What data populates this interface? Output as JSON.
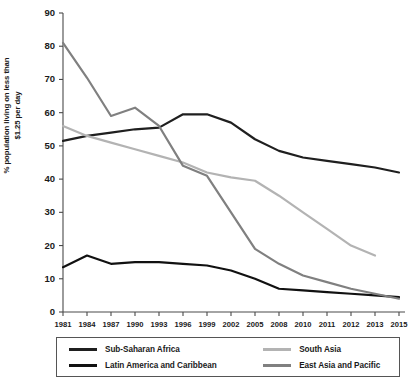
{
  "chart_data": {
    "type": "line",
    "title": "",
    "xlabel": "",
    "ylabel": "% population living on less than $1.25 per day",
    "ylim": [
      0,
      90
    ],
    "ytick_step": 10,
    "grid": false,
    "legend_position": "bottom",
    "categories": [
      "1981",
      "1984",
      "1987",
      "1990",
      "1993",
      "1996",
      "1999",
      "2002",
      "2005",
      "2008",
      "2010",
      "2011",
      "2012",
      "2013",
      "2015"
    ],
    "series": [
      {
        "name": "Sub-Saharan Africa",
        "color": "#1f1f1f",
        "values": [
          51.5,
          53,
          54,
          55,
          55.5,
          59.5,
          59.5,
          57,
          52,
          48.5,
          46.5,
          45.5,
          44.5,
          43.5,
          42
        ]
      },
      {
        "name": "South Asia",
        "color": "#b3b3b3",
        "values": [
          56,
          53,
          51,
          49,
          47,
          45,
          42,
          40.5,
          39.5,
          35,
          30,
          25,
          20,
          17,
          null
        ]
      },
      {
        "name": "Latin America and Caribbean",
        "color": "#111111",
        "values": [
          13.5,
          17,
          14.5,
          15,
          15,
          14.5,
          14,
          12.5,
          10,
          7,
          6.5,
          6,
          5.5,
          5,
          4.5
        ]
      },
      {
        "name": "East Asia and Pacific",
        "color": "#808080",
        "values": [
          81,
          70.5,
          59,
          61.5,
          56,
          44,
          41,
          30,
          19,
          14.5,
          11,
          9,
          7,
          5.5,
          4
        ]
      }
    ],
    "ytick_labels": [
      "0",
      "10",
      "20",
      "30",
      "40",
      "50",
      "60",
      "70",
      "80",
      "90"
    ]
  },
  "legend": {
    "entries": [
      {
        "label": "Sub-Saharan Africa",
        "color": "#1f1f1f"
      },
      {
        "label": "South Asia",
        "color": "#b3b3b3"
      },
      {
        "label": "Latin America and Caribbean",
        "color": "#111111"
      },
      {
        "label": "East Asia and Pacific",
        "color": "#808080"
      }
    ]
  }
}
